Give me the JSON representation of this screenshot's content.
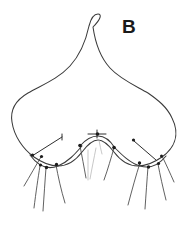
{
  "figure": {
    "panel_label": "B",
    "panel_label_x": 122,
    "panel_label_y": 17,
    "canvas": {
      "width": 185,
      "height": 228,
      "background": "#ffffff"
    },
    "colors": {
      "outline_stroke": "#3a3a3a",
      "seta_stroke": "#444444",
      "leader_stroke": "#2e2e2e",
      "faint_stroke": "#b9b9b9",
      "dot_fill": "#1c1c1c",
      "background": "#ffffff"
    }
  },
  "chart_data": {
    "type": "line",
    "title": "B",
    "xlabel": "",
    "ylabel": "",
    "xlim": [
      0,
      185
    ],
    "ylim": [
      228,
      0
    ],
    "grid": false,
    "legend": "none",
    "series": [
      {
        "name": "body-outline",
        "kind": "closed-outline",
        "path": "M 98 14 C 94 14 91 18 89 26 C 86 40 80 55 70 66 C 58 79 42 85 28 93 C 16 100 10 110 12 122 C 14 136 23 149 34 157 C 44 164 52 166 58 166 C 68 166 76 160 82 152 C 88 144 93 140 98 140 C 103 140 108 144 114 152 C 120 160 128 166 138 166 C 144 166 152 164 162 157 C 173 149 181 136 172 118 C 167 107 158 100 148 93 C 134 85 120 79 110 68 C 100 57 95 41 93 27 C 101 19 102 14 98 14 Z"
      },
      {
        "name": "ventral-margin-arc-left",
        "kind": "arc",
        "path": "M 30 155 C 38 166 48 170 58 166 C 68 162 75 154 82 146"
      },
      {
        "name": "ventral-margin-arc-right",
        "kind": "arc",
        "path": "M 114 147 C 122 155 130 163 140 166 C 150 169 158 166 166 156"
      },
      {
        "name": "median-lobe-arc",
        "kind": "arc",
        "path": "M 80 146 C 86 139 92 136 98 136 C 104 136 110 140 115 148"
      }
    ],
    "node_dots": [
      {
        "name": "left-socket-1",
        "x": 41.5,
        "y": 156.5,
        "r": 1.6
      },
      {
        "name": "left-socket-2",
        "x": 40.5,
        "y": 165.0,
        "r": 1.6
      },
      {
        "name": "left-socket-3",
        "x": 46.5,
        "y": 167.5,
        "r": 1.7
      },
      {
        "name": "left-socket-4",
        "x": 56.5,
        "y": 164.5,
        "r": 1.7
      },
      {
        "name": "median-socket-left",
        "x": 80.0,
        "y": 145.5,
        "r": 1.8
      },
      {
        "name": "median-socket-apex",
        "x": 97.5,
        "y": 134.0,
        "r": 1.8
      },
      {
        "name": "median-socket-right",
        "x": 114.0,
        "y": 147.5,
        "r": 1.8
      },
      {
        "name": "right-socket-1",
        "x": 139.5,
        "y": 163.0,
        "r": 1.7
      },
      {
        "name": "right-socket-2",
        "x": 148.5,
        "y": 167.0,
        "r": 1.7
      },
      {
        "name": "right-socket-3",
        "x": 158.5,
        "y": 163.5,
        "r": 1.6
      },
      {
        "name": "right-socket-4",
        "x": 161.5,
        "y": 156.0,
        "r": 1.5
      },
      {
        "name": "leader-left-origin",
        "x": 32.5,
        "y": 155.0,
        "r": 1.6
      },
      {
        "name": "leader-right-origin",
        "x": 133.5,
        "y": 140.0,
        "r": 1.6
      }
    ],
    "setae": [
      {
        "name": "seta-left-1",
        "path": "M 41 157 C 36 165 30 176 24 186"
      },
      {
        "name": "seta-left-2",
        "path": "M 40 166 C 38 178 36 192 34 208"
      },
      {
        "name": "seta-left-3",
        "path": "M 46 168 C 45 181 44 196 43 211"
      },
      {
        "name": "seta-left-4",
        "path": "M 56 165 C 58 176 61 190 65 203"
      },
      {
        "name": "seta-median-left",
        "path": "M 80 146 C 82 156 84 167 86 178"
      },
      {
        "name": "seta-median-right",
        "path": "M 114 148 C 111 158 108 169 104 180"
      },
      {
        "name": "seta-right-1",
        "path": "M 140 163 C 136 175 132 190 128 205"
      },
      {
        "name": "seta-right-2",
        "path": "M 148 167 C 147 180 146 194 145 209"
      },
      {
        "name": "seta-right-3",
        "path": "M 158 164 C 160 175 163 188 166 200"
      },
      {
        "name": "seta-right-4",
        "path": "M 162 156 C 166 164 170 173 174 182"
      }
    ],
    "leader_lines": [
      {
        "name": "leader-left",
        "path": "M 32 156 L 62 137",
        "tick": "M 62 134 L 62 140"
      },
      {
        "name": "leader-median",
        "path": "M 88 134 L 106 134",
        "tick": "M 97 130 L 97 138"
      },
      {
        "name": "leader-right",
        "path": "M 134 141 L 156 160",
        "tick": ""
      }
    ],
    "faint_lines": [
      {
        "name": "faint-median-v-left",
        "path": "M 88 150 C 88 160 88 170 88 180"
      },
      {
        "name": "faint-median-v-right",
        "path": "M 96 148 C 94 158 92 168 90 179"
      },
      {
        "name": "faint-median-stub",
        "path": "M 99 140 C 100 146 101 150 102 154"
      }
    ]
  }
}
